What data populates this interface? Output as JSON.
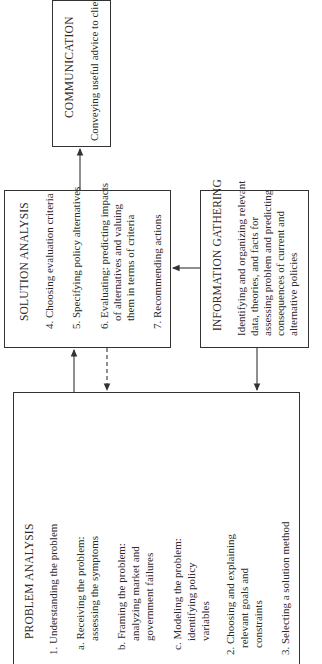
{
  "diagram": {
    "orientation": "rotated -90deg (text reads bottom-to-top)",
    "communication": {
      "title": "COMMUNICATION",
      "line1": "Conveying useful advice to clients"
    },
    "solution_analysis": {
      "title": "SOLUTION ANALYSIS",
      "items": [
        "4. Choosing evaluation criteria",
        "5. Specifying policy alternatives",
        "6. Evaluating: predicting impacts",
        "of alternatives and valuing",
        "them in terms of criteria",
        "7. Recommending actions"
      ]
    },
    "information_gathering": {
      "title": "INFORMATION GATHERING",
      "lines": [
        "Identifying and organizing relevant",
        "data, theories, and facts for",
        "assessing problem and predicting",
        "consequences of current and",
        "alternative policies"
      ]
    },
    "problem_analysis": {
      "title": "PROBLEM ANALYSIS",
      "items": [
        "1. Understanding the problem",
        "a. Receiving the problem:",
        "assessing the symptoms",
        "b. Framing the problem:",
        "analyzing market and",
        "government failures",
        "c. Modeling the problem:",
        "identifying policy",
        "variables",
        "2. Choosing and explaining",
        "relevant goals and",
        "constraints",
        "3. Selecting a solution method"
      ]
    },
    "connections": [
      {
        "from": "solution_analysis",
        "to": "communication",
        "style": "solid"
      },
      {
        "from": "information_gathering",
        "to": "solution_analysis",
        "style": "solid"
      },
      {
        "from": "problem_analysis",
        "to": "solution_analysis",
        "style": "solid"
      },
      {
        "from": "solution_analysis",
        "to": "problem_analysis",
        "style": "dashed"
      },
      {
        "from": "information_gathering",
        "to": "problem_analysis",
        "style": "solid"
      }
    ]
  }
}
